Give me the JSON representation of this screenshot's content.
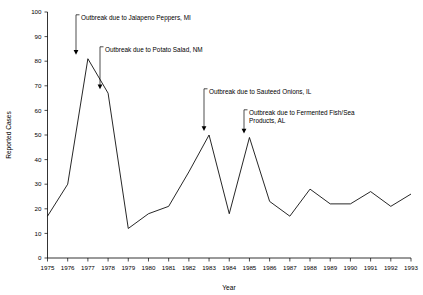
{
  "chart_data": {
    "type": "line",
    "title": "",
    "xlabel": "Year",
    "ylabel": "Reported Cases",
    "xlim": [
      1975,
      1993
    ],
    "ylim": [
      0,
      100
    ],
    "grid": false,
    "legend": "none",
    "categories": [
      1975,
      1976,
      1977,
      1978,
      1979,
      1980,
      1981,
      1982,
      1983,
      1984,
      1985,
      1986,
      1987,
      1988,
      1989,
      1990,
      1991,
      1992,
      1993
    ],
    "values": [
      17,
      30,
      81,
      67,
      12,
      18,
      21,
      35,
      50,
      18,
      49,
      23,
      17,
      28,
      22,
      22,
      27,
      21,
      26
    ],
    "ytick_labels": [
      "0",
      "10",
      "20",
      "30",
      "40",
      "50",
      "60",
      "70",
      "80",
      "90",
      "100"
    ],
    "ytick_values": [
      0,
      10,
      20,
      30,
      40,
      50,
      60,
      70,
      80,
      90,
      100
    ],
    "xtick_labels": [
      "1975",
      "1976",
      "1977",
      "1978",
      "1979",
      "1980",
      "1981",
      "1982",
      "1983",
      "1984",
      "1985",
      "1986",
      "1987",
      "1988",
      "1989",
      "1990",
      "1991",
      "1992",
      "1993"
    ],
    "annotations": [
      {
        "id": "jalapeno-peppers",
        "text": "Outbreak due to Jalapeno Peppers, MI",
        "text_line2": "",
        "point_year": 1977,
        "point_value": 81
      },
      {
        "id": "potato-salad",
        "text": "Outbreak due to Potato Salad, NM",
        "text_line2": "",
        "point_year": 1978,
        "point_value": 67
      },
      {
        "id": "sauteed-onions",
        "text": "Outbreak due to Sauteed Onions, IL",
        "text_line2": "",
        "point_year": 1983,
        "point_value": 50
      },
      {
        "id": "fermented-fish",
        "text": "Outbreak due to Fermented Fish/Sea",
        "text_line2": "Products, AL",
        "point_year": 1985,
        "point_value": 49
      }
    ],
    "colors": {
      "line": "#000000",
      "axis": "#000000",
      "background": "#ffffff",
      "text": "#000000"
    }
  }
}
